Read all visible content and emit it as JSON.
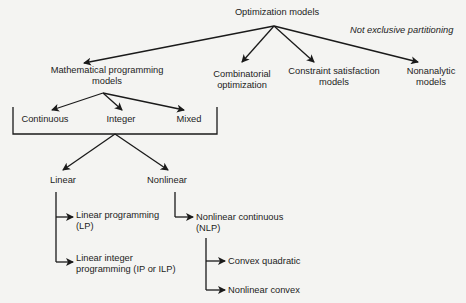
{
  "diagram": {
    "title": "Optimization models",
    "annotation": "Not exclusive partitioning",
    "level1": [
      {
        "id": "math",
        "label_line1": "Mathematical programming",
        "label_line2": "models"
      },
      {
        "id": "comb",
        "label_line1": "Combinatorial",
        "label_line2": "optimization"
      },
      {
        "id": "csm",
        "label_line1": "Constraint satisfaction",
        "label_line2": "models"
      },
      {
        "id": "nonanalytic",
        "label_line1": "Nonanalytic",
        "label_line2": "models"
      }
    ],
    "variable_types": [
      "Continuous",
      "Integer",
      "Mixed"
    ],
    "linearity": [
      "Linear",
      "Nonlinear"
    ],
    "linear_children": [
      {
        "label_line1": "Linear programming",
        "label_line2": "(LP)"
      },
      {
        "label_line1": "Linear integer",
        "label_line2": "programming (IP or ILP)"
      }
    ],
    "nonlinear_children": [
      {
        "label_line1": "Nonlinear continuous",
        "label_line2": "(NLP)"
      }
    ],
    "nlp_children": [
      "Convex quadratic",
      "Nonlinear convex"
    ]
  }
}
